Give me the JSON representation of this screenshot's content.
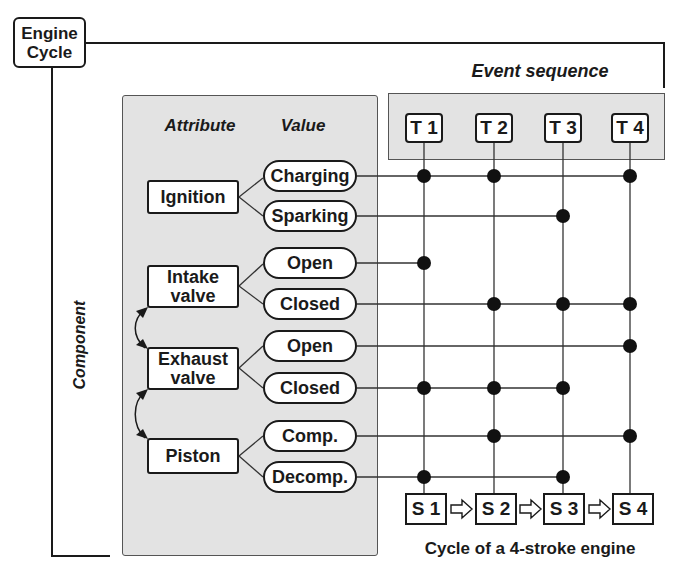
{
  "title": "Engine Cycle",
  "title_lines": [
    "Engine",
    "Cycle"
  ],
  "axis_labels": {
    "component": "Component",
    "attribute": "Attribute",
    "value": "Value",
    "event_sequence": "Event sequence"
  },
  "events": [
    "T 1",
    "T 2",
    "T 3",
    "T 4"
  ],
  "strokes": [
    "S 1",
    "S 2",
    "S 3",
    "S 4"
  ],
  "caption": "Cycle of a 4-stroke engine",
  "components": [
    {
      "name": "Ignition",
      "lines": [
        "Ignition"
      ],
      "values": [
        "Charging",
        "Sparking"
      ]
    },
    {
      "name": "Intake valve",
      "lines": [
        "Intake",
        "valve"
      ],
      "values": [
        "Open",
        "Closed"
      ]
    },
    {
      "name": "Exhaust valve",
      "lines": [
        "Exhaust",
        "valve"
      ],
      "values": [
        "Open",
        "Closed"
      ]
    },
    {
      "name": "Piston",
      "lines": [
        "Piston"
      ],
      "values": [
        "Comp.",
        "Decomp."
      ]
    }
  ],
  "event_matrix": [
    {
      "component": "Ignition",
      "value": "Charging",
      "active": [
        "T1",
        "T2",
        "T4"
      ]
    },
    {
      "component": "Ignition",
      "value": "Sparking",
      "active": [
        "T3"
      ]
    },
    {
      "component": "Intake valve",
      "value": "Open",
      "active": [
        "T1"
      ]
    },
    {
      "component": "Intake valve",
      "value": "Closed",
      "active": [
        "T2",
        "T3",
        "T4"
      ]
    },
    {
      "component": "Exhaust valve",
      "value": "Open",
      "active": [
        "T4"
      ]
    },
    {
      "component": "Exhaust valve",
      "value": "Closed",
      "active": [
        "T1",
        "T2",
        "T3"
      ]
    },
    {
      "component": "Piston",
      "value": "Comp.",
      "active": [
        "T2",
        "T4"
      ]
    },
    {
      "component": "Piston",
      "value": "Decomp.",
      "active": [
        "T1",
        "T3"
      ]
    }
  ],
  "stroke_sequence_arrow": "⇨",
  "colors": {
    "panel": "#e3e3e3",
    "ink": "#1a1a1a",
    "background": "#ffffff"
  }
}
